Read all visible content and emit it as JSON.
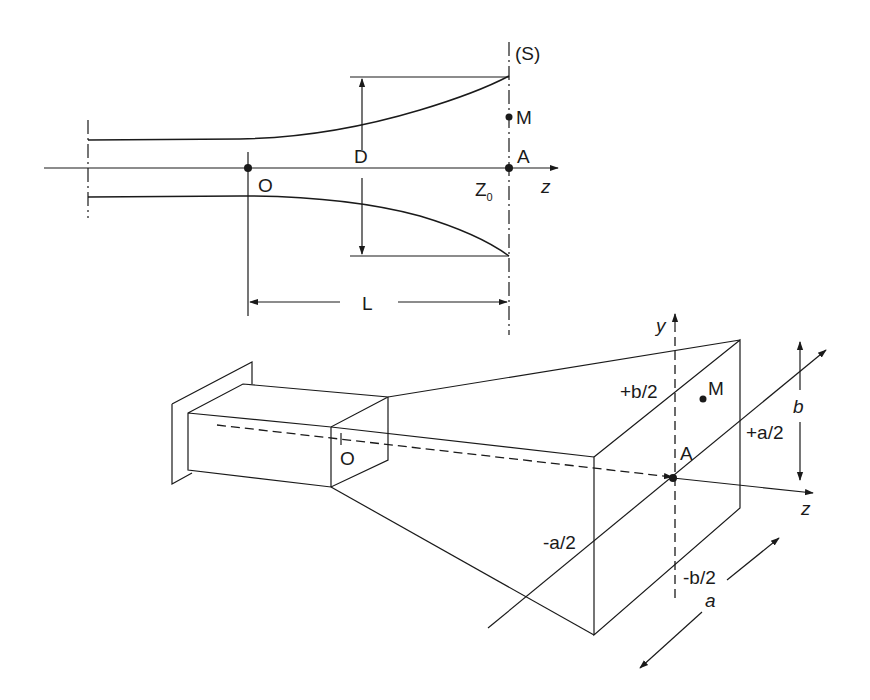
{
  "figure": {
    "top_view": {
      "title": "Longitudinal section of flared horn",
      "labels": {
        "surface": "(S)",
        "point_m": "M",
        "point_a": "A",
        "origin": "O",
        "z_axis": "z",
        "z0_main": "Z",
        "z0_sub": "0",
        "aperture_dim": "D",
        "length_dim": "L"
      }
    },
    "bottom_view": {
      "title": "Pyramidal horn in perspective",
      "labels": {
        "y_axis": "y",
        "z_axis": "z",
        "point_m": "M",
        "point_a": "A",
        "origin": "O",
        "plus_b_half": "+b/2",
        "minus_b_half": "-b/2",
        "plus_a_half": "+a/2",
        "minus_a_half": "-a/2",
        "dim_b": "b",
        "dim_a": "a"
      }
    },
    "colors": {
      "ink": "#1a1a1a",
      "background": "#ffffff"
    }
  }
}
